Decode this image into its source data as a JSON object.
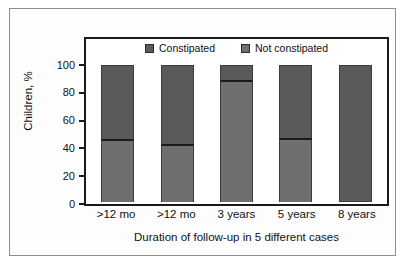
{
  "chart_data": {
    "type": "bar",
    "subtype": "stacked-bar-100",
    "title": "",
    "xlabel": "Duration of follow-up in 5 different cases",
    "ylabel": "Children, %",
    "categories": [
      ">12 mo",
      ">12 mo",
      "3 years",
      "5 years",
      "8 years"
    ],
    "series": [
      {
        "name": "Not constipated",
        "values": [
          46,
          42,
          89,
          47,
          0
        ],
        "color": "#6f6f6f"
      },
      {
        "name": "Constipated",
        "values": [
          54,
          58,
          11,
          53,
          100
        ],
        "color": "#5a5a5a"
      }
    ],
    "ylim": [
      0,
      100
    ],
    "yticks": [
      0,
      20,
      40,
      60,
      80,
      100
    ],
    "ytick_labels": [
      "0",
      "20",
      "40",
      "60",
      "80",
      "100"
    ],
    "grid": false,
    "legend_position": "top-center",
    "legend": [
      "Constipated",
      "Not constipated"
    ],
    "annotations": []
  },
  "legend": {
    "items": [
      {
        "label": "Constipated",
        "color": "#5a5a5a"
      },
      {
        "label": "Not constipated",
        "color": "#6f6f6f"
      }
    ]
  },
  "axes": {
    "y": {
      "title": "Children, %",
      "ticks": [
        "100",
        "80",
        "60",
        "40",
        "20",
        "0"
      ]
    },
    "x": {
      "title": "Duration of follow-up in 5 different cases",
      "ticks": [
        ">12 mo",
        ">12 mo",
        "3 years",
        "5 years",
        "8 years"
      ]
    }
  }
}
